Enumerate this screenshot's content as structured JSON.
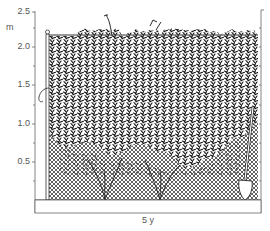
{
  "figure": {
    "y_axis": {
      "unit": "m",
      "ticks": [
        {
          "label": "2.5",
          "value": 2.5
        },
        {
          "label": "2.0",
          "value": 2.0
        },
        {
          "label": "1.5",
          "value": 1.5
        },
        {
          "label": "1.0",
          "value": 1.0
        },
        {
          "label": "0.5",
          "value": 0.5
        }
      ],
      "range": [
        0,
        2.5
      ]
    },
    "caption": "5 y",
    "elements": [
      "chain-link fence",
      "fence post",
      "foliage",
      "shovel",
      "ground"
    ],
    "colors": {
      "ink": "#1a1a1a",
      "axis": "#777777",
      "mesh": "#444444",
      "background": "#ffffff"
    }
  }
}
